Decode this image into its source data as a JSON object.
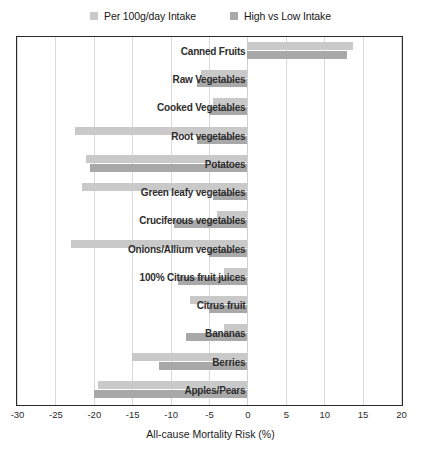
{
  "chart_data": {
    "type": "bar",
    "orientation": "horizontal",
    "title": "",
    "xlabel": "All-cause Mortality Risk (%)",
    "ylabel": "",
    "xlim": [
      -30,
      20
    ],
    "xticks": [
      -30,
      -25,
      -20,
      -15,
      -10,
      -5,
      0,
      5,
      10,
      15,
      20
    ],
    "xtick_labels": [
      "-30",
      "-25",
      "-20",
      "-15",
      "-10",
      "-5",
      "0",
      "5",
      "10",
      "15",
      "20"
    ],
    "grid": true,
    "legend_position": "top-center",
    "categories": [
      "Canned Fruits",
      "Raw Vegetables",
      "Cooked Vegetables",
      "Root vegetables",
      "Potatoes",
      "Green leafy vegetables",
      "Cruciferous vegetables",
      "Onions/Allium vegetables",
      "100% Citrus fruit juices",
      "Citrus fruit",
      "Bananas",
      "Berries",
      "Apples/Pears"
    ],
    "series": [
      {
        "name": "Per 100g/day Intake",
        "color": "#c9c9c9",
        "values": [
          13.7,
          -6.0,
          -4.5,
          -22.5,
          -21.0,
          -21.5,
          -4.0,
          -23.0,
          -3.0,
          -7.5,
          -3.0,
          -15.0,
          -19.5
        ]
      },
      {
        "name": "High vs Low Intake",
        "color": "#a8a8a8",
        "values": [
          13.0,
          -6.5,
          -5.0,
          -6.5,
          -20.5,
          -4.5,
          -9.5,
          -5.0,
          -9.0,
          -5.0,
          -8.0,
          -11.5,
          -20.0
        ]
      }
    ]
  },
  "legend": {
    "items": [
      {
        "label": "Per 100g/day Intake",
        "color": "#c9c9c9"
      },
      {
        "label": "High vs Low Intake",
        "color": "#a8a8a8"
      }
    ]
  },
  "axis": {
    "x_title": "All-cause Mortality Risk (%)"
  }
}
